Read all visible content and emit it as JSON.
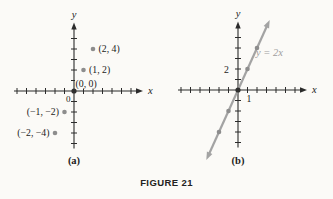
{
  "figure": {
    "caption": "FIGURE 21",
    "background": "#fbfaf7"
  },
  "colors": {
    "axis": "#2b2b2b",
    "text": "#1c1c1c",
    "point": "#8d8d8d",
    "origin_point": "#303030",
    "line": "#a3a3a3",
    "line_label": "#9e9e9e"
  },
  "chart_data": [
    {
      "type": "scatter",
      "panel_label": "(a)",
      "xlabel": "x",
      "ylabel": "y",
      "origin_label": "0",
      "xlim": [
        -6,
        6
      ],
      "ylim": [
        -5,
        5
      ],
      "grid": false,
      "points": [
        {
          "x": -2,
          "y": -4,
          "label": "(−2, −4)",
          "side": "left"
        },
        {
          "x": -1,
          "y": -2,
          "label": "(−1, −2)",
          "side": "left"
        },
        {
          "x": 0,
          "y": 0,
          "label": "(0, 0)",
          "side": "above-right",
          "origin": true
        },
        {
          "x": 1,
          "y": 2,
          "label": "(1, 2)",
          "side": "right"
        },
        {
          "x": 2,
          "y": 4,
          "label": "(2, 4)",
          "side": "right"
        }
      ]
    },
    {
      "type": "line",
      "panel_label": "(b)",
      "equation_label": "y = 2x",
      "xlabel": "x",
      "ylabel": "y",
      "xlim": [
        -6,
        6
      ],
      "ylim": [
        -5,
        5
      ],
      "grid": false,
      "x_tick_label": {
        "value": 1,
        "text": "1"
      },
      "y_tick_label": {
        "value": 2,
        "text": "2"
      },
      "line": {
        "slope": 2,
        "intercept": 0,
        "x_range": [
          -2.9,
          2.9
        ]
      },
      "points": [
        {
          "x": -2,
          "y": -4
        },
        {
          "x": -1,
          "y": -2
        },
        {
          "x": 0,
          "y": 0,
          "origin": true
        },
        {
          "x": 1,
          "y": 2
        },
        {
          "x": 2,
          "y": 4
        }
      ]
    }
  ]
}
